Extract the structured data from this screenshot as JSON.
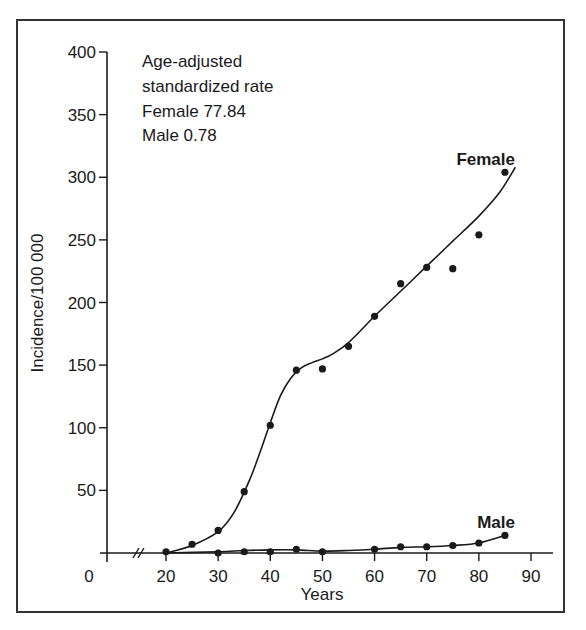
{
  "chart_data": {
    "type": "scatter",
    "title": "",
    "xlabel": "Years",
    "ylabel": "Incidence/100 000",
    "xlim": [
      0,
      90
    ],
    "ylim": [
      0,
      400
    ],
    "x_axis_break": true,
    "x_ticks": [
      0,
      20,
      30,
      40,
      50,
      60,
      70,
      80,
      90
    ],
    "y_ticks": [
      50,
      100,
      150,
      200,
      250,
      300,
      350,
      400
    ],
    "grid": false,
    "annotation": {
      "lines": [
        "Age-adjusted",
        "standardized rate",
        "Female 77.84",
        "Male 0.78"
      ]
    },
    "series": [
      {
        "name": "Female",
        "label": "Female",
        "points": [
          {
            "x": 20,
            "y": 1
          },
          {
            "x": 25,
            "y": 7
          },
          {
            "x": 30,
            "y": 18
          },
          {
            "x": 35,
            "y": 49
          },
          {
            "x": 40,
            "y": 102
          },
          {
            "x": 45,
            "y": 146
          },
          {
            "x": 50,
            "y": 147
          },
          {
            "x": 55,
            "y": 165
          },
          {
            "x": 60,
            "y": 189
          },
          {
            "x": 65,
            "y": 215
          },
          {
            "x": 70,
            "y": 228
          },
          {
            "x": 75,
            "y": 227
          },
          {
            "x": 80,
            "y": 254
          },
          {
            "x": 85,
            "y": 304
          }
        ],
        "fit_curve": [
          [
            20,
            0
          ],
          [
            25,
            6
          ],
          [
            30,
            17
          ],
          [
            33,
            32
          ],
          [
            36,
            58
          ],
          [
            38,
            80
          ],
          [
            40,
            104
          ],
          [
            42,
            126
          ],
          [
            44,
            140
          ],
          [
            46,
            148
          ],
          [
            48,
            152
          ],
          [
            50,
            155
          ],
          [
            52,
            159
          ],
          [
            55,
            168
          ],
          [
            60,
            189
          ],
          [
            65,
            209
          ],
          [
            70,
            229
          ],
          [
            75,
            249
          ],
          [
            80,
            269
          ],
          [
            84,
            288
          ],
          [
            87,
            308
          ]
        ]
      },
      {
        "name": "Male",
        "label": "Male",
        "points": [
          {
            "x": 30,
            "y": 0
          },
          {
            "x": 35,
            "y": 1
          },
          {
            "x": 40,
            "y": 1
          },
          {
            "x": 45,
            "y": 3
          },
          {
            "x": 50,
            "y": 1
          },
          {
            "x": 60,
            "y": 3
          },
          {
            "x": 65,
            "y": 5
          },
          {
            "x": 70,
            "y": 5
          },
          {
            "x": 75,
            "y": 6
          },
          {
            "x": 80,
            "y": 8
          },
          {
            "x": 85,
            "y": 14
          }
        ],
        "fit_curve": [
          [
            20,
            0
          ],
          [
            30,
            1
          ],
          [
            35,
            2
          ],
          [
            40,
            2.5
          ],
          [
            45,
            2.5
          ],
          [
            50,
            1.5
          ],
          [
            55,
            2
          ],
          [
            60,
            3
          ],
          [
            65,
            4.5
          ],
          [
            70,
            5
          ],
          [
            75,
            6
          ],
          [
            80,
            8
          ],
          [
            85,
            14
          ]
        ]
      }
    ]
  },
  "colors": {
    "ink": "#1a1a1a",
    "frame": "#333333",
    "background": "#ffffff"
  }
}
